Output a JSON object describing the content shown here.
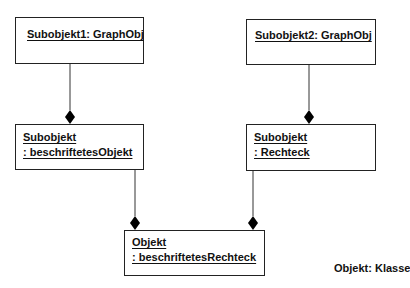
{
  "diagram": {
    "type": "UML object diagram (composition)",
    "objects": [
      {
        "id": "o1",
        "line1": "Subobjekt1: GraphObj",
        "line2": ""
      },
      {
        "id": "o2",
        "line1": "Subobjekt2: GraphObj",
        "line2": ""
      },
      {
        "id": "o3",
        "line1": "Subobjekt",
        "line2": ": beschriftetesObjekt"
      },
      {
        "id": "o4",
        "line1": "Subobjekt",
        "line2": ": Rechteck"
      },
      {
        "id": "o5",
        "line1": "Objekt",
        "line2": ": beschriftetesRechteck"
      }
    ],
    "links": [
      {
        "part": "Subobjekt1: GraphObj",
        "whole": "Subobjekt : beschriftetesObjekt",
        "kind": "composition"
      },
      {
        "part": "Subobjekt2: GraphObj",
        "whole": "Subobjekt : Rechteck",
        "kind": "composition"
      },
      {
        "part": "Subobjekt : beschriftetesObjekt",
        "whole": "Objekt : beschriftetesRechteck",
        "kind": "composition"
      },
      {
        "part": "Subobjekt : Rechteck",
        "whole": "Objekt : beschriftetesRechteck",
        "kind": "composition"
      }
    ],
    "legend": "Objekt: Klasse"
  }
}
